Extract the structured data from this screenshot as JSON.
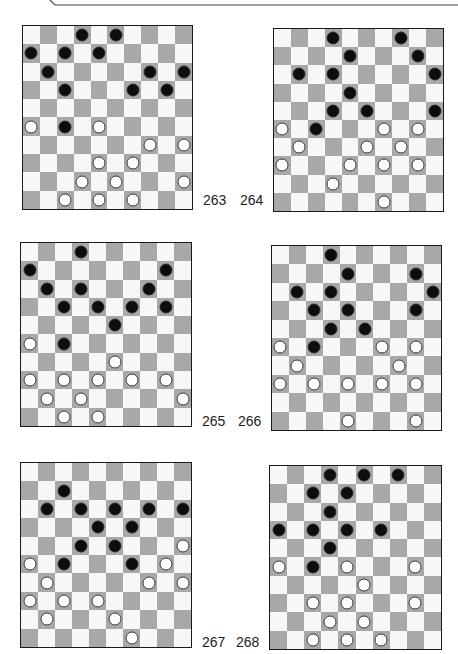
{
  "page": {
    "board_size": 10,
    "colors": {
      "dark_square": "#a8a8a8",
      "light_square": "#f7f7f7",
      "black_piece": "#0d0d0d",
      "white_piece": "#ffffff",
      "border": "#1a1a1a"
    }
  },
  "diagrams": [
    {
      "number": "263",
      "black": [
        [
          0,
          3
        ],
        [
          0,
          5
        ],
        [
          1,
          0
        ],
        [
          1,
          2
        ],
        [
          1,
          4
        ],
        [
          2,
          1
        ],
        [
          2,
          7
        ],
        [
          2,
          9
        ],
        [
          3,
          2
        ],
        [
          3,
          6
        ],
        [
          3,
          8
        ],
        [
          5,
          2
        ]
      ],
      "white": [
        [
          5,
          0
        ],
        [
          5,
          4
        ],
        [
          6,
          7
        ],
        [
          6,
          9
        ],
        [
          7,
          4
        ],
        [
          7,
          6
        ],
        [
          8,
          3
        ],
        [
          8,
          5
        ],
        [
          8,
          9
        ],
        [
          9,
          2
        ],
        [
          9,
          4
        ],
        [
          9,
          6
        ]
      ]
    },
    {
      "number": "264",
      "black": [
        [
          0,
          3
        ],
        [
          0,
          7
        ],
        [
          1,
          4
        ],
        [
          1,
          8
        ],
        [
          2,
          1
        ],
        [
          2,
          3
        ],
        [
          2,
          9
        ],
        [
          3,
          4
        ],
        [
          4,
          3
        ],
        [
          4,
          5
        ],
        [
          4,
          9
        ],
        [
          5,
          2
        ]
      ],
      "white": [
        [
          5,
          0
        ],
        [
          5,
          6
        ],
        [
          5,
          8
        ],
        [
          6,
          1
        ],
        [
          6,
          5
        ],
        [
          6,
          7
        ],
        [
          7,
          0
        ],
        [
          7,
          4
        ],
        [
          7,
          6
        ],
        [
          7,
          8
        ],
        [
          8,
          3
        ],
        [
          9,
          6
        ]
      ]
    },
    {
      "number": "265",
      "black": [
        [
          0,
          3
        ],
        [
          1,
          0
        ],
        [
          1,
          8
        ],
        [
          2,
          1
        ],
        [
          2,
          3
        ],
        [
          2,
          7
        ],
        [
          3,
          2
        ],
        [
          3,
          4
        ],
        [
          3,
          6
        ],
        [
          3,
          8
        ],
        [
          4,
          5
        ],
        [
          5,
          2
        ]
      ],
      "white": [
        [
          5,
          0
        ],
        [
          6,
          5
        ],
        [
          7,
          0
        ],
        [
          7,
          2
        ],
        [
          7,
          4
        ],
        [
          7,
          6
        ],
        [
          7,
          8
        ],
        [
          8,
          1
        ],
        [
          8,
          3
        ],
        [
          8,
          9
        ],
        [
          9,
          2
        ],
        [
          9,
          4
        ]
      ]
    },
    {
      "number": "266",
      "black": [
        [
          0,
          3
        ],
        [
          1,
          4
        ],
        [
          1,
          8
        ],
        [
          2,
          1
        ],
        [
          2,
          3
        ],
        [
          2,
          9
        ],
        [
          3,
          2
        ],
        [
          3,
          4
        ],
        [
          3,
          8
        ],
        [
          4,
          3
        ],
        [
          4,
          5
        ],
        [
          5,
          2
        ]
      ],
      "white": [
        [
          5,
          0
        ],
        [
          5,
          6
        ],
        [
          5,
          8
        ],
        [
          6,
          1
        ],
        [
          6,
          7
        ],
        [
          7,
          0
        ],
        [
          7,
          2
        ],
        [
          7,
          4
        ],
        [
          7,
          6
        ],
        [
          7,
          8
        ],
        [
          9,
          4
        ],
        [
          9,
          8
        ]
      ]
    },
    {
      "number": "267",
      "black": [
        [
          1,
          2
        ],
        [
          2,
          1
        ],
        [
          2,
          3
        ],
        [
          2,
          5
        ],
        [
          2,
          7
        ],
        [
          2,
          9
        ],
        [
          3,
          4
        ],
        [
          3,
          6
        ],
        [
          4,
          3
        ],
        [
          4,
          5
        ],
        [
          5,
          2
        ],
        [
          5,
          6
        ]
      ],
      "white": [
        [
          4,
          9
        ],
        [
          5,
          0
        ],
        [
          5,
          8
        ],
        [
          6,
          1
        ],
        [
          6,
          7
        ],
        [
          6,
          9
        ],
        [
          7,
          0
        ],
        [
          7,
          2
        ],
        [
          7,
          4
        ],
        [
          8,
          1
        ],
        [
          8,
          5
        ],
        [
          9,
          6
        ]
      ]
    },
    {
      "number": "268",
      "black": [
        [
          0,
          3
        ],
        [
          0,
          5
        ],
        [
          0,
          7
        ],
        [
          1,
          2
        ],
        [
          1,
          4
        ],
        [
          2,
          3
        ],
        [
          3,
          0
        ],
        [
          3,
          2
        ],
        [
          3,
          4
        ],
        [
          3,
          6
        ],
        [
          4,
          3
        ],
        [
          5,
          2
        ]
      ],
      "white": [
        [
          5,
          0
        ],
        [
          5,
          4
        ],
        [
          5,
          8
        ],
        [
          6,
          5
        ],
        [
          7,
          2
        ],
        [
          7,
          4
        ],
        [
          7,
          8
        ],
        [
          8,
          3
        ],
        [
          8,
          5
        ],
        [
          9,
          2
        ],
        [
          9,
          4
        ],
        [
          9,
          6
        ]
      ]
    }
  ]
}
